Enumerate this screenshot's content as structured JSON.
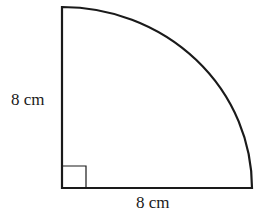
{
  "diagram": {
    "shape": "quarter-circle",
    "labels": {
      "vertical_side": "8 cm",
      "horizontal_side": "8 cm"
    },
    "right_angle_marker": true,
    "stroke_color": "#1a1a1a",
    "fill_color": "#ffffff"
  }
}
